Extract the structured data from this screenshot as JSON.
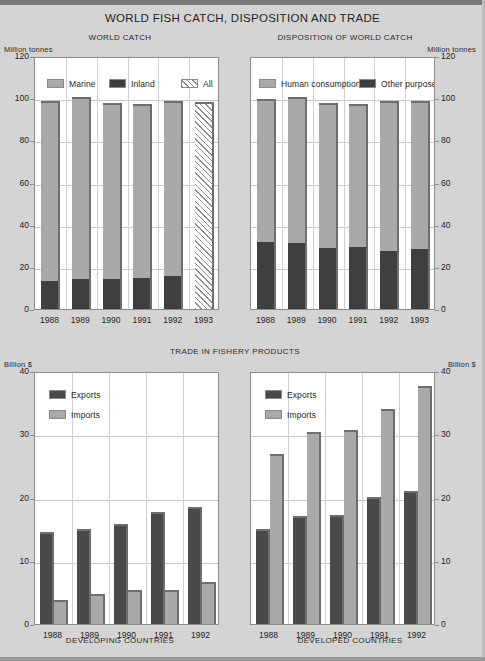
{
  "title": "WORLD FISH CATCH, DISPOSITION AND TRADE",
  "panels": {
    "world_catch": {
      "title": "WORLD CATCH",
      "unit_left": "Million tonnes",
      "legend": [
        {
          "label": "Marine",
          "color": "#a9a9a9"
        },
        {
          "label": "Inland",
          "color": "#3f3f3f"
        },
        {
          "label": "All",
          "color": "hatch"
        }
      ]
    },
    "disposition": {
      "title": "DISPOSITION OF WORLD CATCH",
      "unit_right": "Million tonnes",
      "legend": [
        {
          "label": "Human consumption",
          "color": "#a9a9a9"
        },
        {
          "label": "Other purposes",
          "color": "#3f3f3f"
        }
      ]
    },
    "trade": {
      "title": "TRADE IN FISHERY PRODUCTS",
      "unit_left": "Billion $",
      "unit_right": "Billion $",
      "developing_title": "DEVELOPING COUNTRIES",
      "developed_title": "DEVELOPED COUNTRIES",
      "legend": [
        {
          "label": "Exports",
          "color": "#4a4a4a"
        },
        {
          "label": "Imports",
          "color": "#a9a9a9"
        }
      ]
    }
  },
  "chart_data": [
    {
      "type": "bar",
      "subtype": "stacked",
      "title": "WORLD CATCH",
      "xlabel": "",
      "ylabel": "Million tonnes",
      "ylim": [
        0,
        120
      ],
      "yticks": [
        0,
        20,
        40,
        60,
        80,
        100,
        120
      ],
      "grid": true,
      "legend_position": "inside-top",
      "categories": [
        "1988",
        "1989",
        "1990",
        "1991",
        "1992",
        "1993"
      ],
      "series": [
        {
          "name": "Inland",
          "values": [
            13.2,
            14.0,
            14.2,
            14.7,
            15.5,
            null
          ]
        },
        {
          "name": "Marine",
          "values": [
            85.3,
            86.7,
            83.3,
            82.6,
            83.2,
            null
          ]
        },
        {
          "name": "All",
          "values": [
            null,
            null,
            null,
            null,
            null,
            98.0
          ]
        }
      ],
      "totals": [
        98.5,
        100.7,
        97.5,
        97.3,
        98.7,
        98.0
      ],
      "notes": "1993 shown as a single hatched 'All' bar (estimate)."
    },
    {
      "type": "bar",
      "subtype": "stacked",
      "title": "DISPOSITION OF WORLD CATCH",
      "xlabel": "",
      "ylabel": "Million tonnes",
      "ylim": [
        0,
        120
      ],
      "yticks": [
        0,
        20,
        40,
        60,
        80,
        100,
        120
      ],
      "grid": true,
      "legend_position": "inside-top",
      "categories": [
        "1988",
        "1989",
        "1990",
        "1991",
        "1992",
        "1993"
      ],
      "series": [
        {
          "name": "Other purposes",
          "values": [
            32.0,
            31.2,
            29.0,
            29.5,
            27.5,
            28.5
          ]
        },
        {
          "name": "Human consumption",
          "values": [
            67.5,
            69.5,
            68.5,
            67.8,
            71.2,
            70.2
          ]
        }
      ],
      "totals": [
        99.5,
        100.7,
        97.5,
        97.3,
        98.7,
        98.7
      ]
    },
    {
      "type": "bar",
      "subtype": "grouped",
      "title": "TRADE IN FISHERY PRODUCTS — DEVELOPING COUNTRIES",
      "xlabel": "DEVELOPING COUNTRIES",
      "ylabel": "Billion $",
      "ylim": [
        0,
        40
      ],
      "yticks": [
        0,
        10,
        20,
        30,
        40
      ],
      "grid": true,
      "legend_position": "inside-top-left",
      "categories": [
        "1988",
        "1989",
        "1990",
        "1991",
        "1992"
      ],
      "series": [
        {
          "name": "Exports",
          "values": [
            14.5,
            15.0,
            15.8,
            17.7,
            18.5
          ]
        },
        {
          "name": "Imports",
          "values": [
            3.8,
            4.7,
            5.3,
            5.4,
            6.6
          ]
        }
      ]
    },
    {
      "type": "bar",
      "subtype": "grouped",
      "title": "TRADE IN FISHERY PRODUCTS — DEVELOPED COUNTRIES",
      "xlabel": "DEVELOPED COUNTRIES",
      "ylabel": "Billion $",
      "ylim": [
        0,
        40
      ],
      "yticks": [
        0,
        10,
        20,
        30,
        40
      ],
      "grid": true,
      "legend_position": "inside-top-left",
      "categories": [
        "1988",
        "1989",
        "1990",
        "1991",
        "1992"
      ],
      "series": [
        {
          "name": "Exports",
          "values": [
            15.0,
            17.0,
            17.2,
            20.0,
            21.0
          ]
        },
        {
          "name": "Imports",
          "values": [
            26.8,
            30.3,
            30.6,
            34.0,
            37.6
          ]
        }
      ]
    }
  ],
  "colors": {
    "light_gray": "#a9a9a9",
    "dark_gray": "#3f3f3f",
    "dark_bar": "#4a4a4a",
    "background": "#d4d4d4",
    "plot_background": "#ffffff",
    "grid": "#c9c9c9"
  }
}
